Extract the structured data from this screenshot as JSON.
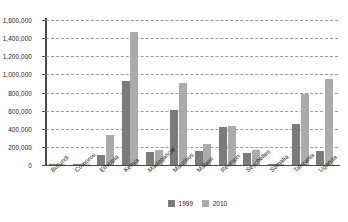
{
  "chart_data": {
    "type": "bar",
    "title": "",
    "subtitle": "",
    "xlabel": "",
    "ylabel": "",
    "ylim": [
      0,
      1600000
    ],
    "ytick_step": 200000,
    "ytick_labels": [
      "0",
      "200,000",
      "400,000",
      "600,000",
      "800,000",
      "1,000,000",
      "1,200,000",
      "1,400,000",
      "1,600,000"
    ],
    "ytick_values": [
      0,
      200000,
      400000,
      600000,
      800000,
      1000000,
      1200000,
      1400000,
      1600000
    ],
    "grid": true,
    "grid_style": "dashed-horizontal",
    "legend_position": "bottom-center",
    "categories": [
      "Burundi",
      "Comoros",
      "Ethiopia",
      "Kenya",
      "Madagascar",
      "Mauritius",
      "Malawi",
      "Reunion",
      "Seychelles",
      "Somalia",
      "Tanzania",
      "Uganda"
    ],
    "series": [
      {
        "name": "1999",
        "color": "#7b7b7b",
        "values": [
          3000,
          4000,
          115000,
          930000,
          140000,
          610000,
          160000,
          420000,
          130000,
          10000,
          450000,
          150000
        ]
      },
      {
        "name": "2010",
        "color": "#ababab",
        "values": [
          6000,
          15000,
          330000,
          1470000,
          170000,
          910000,
          230000,
          430000,
          170000,
          12000,
          780000,
          950000
        ]
      }
    ]
  },
  "colors": {
    "series_1999": "#7b7b7b",
    "series_2010": "#ababab",
    "axis": "#4a4a4a",
    "gridline": "#9a9a9a",
    "text": "#1a1a1a",
    "background": "#ffffff"
  }
}
